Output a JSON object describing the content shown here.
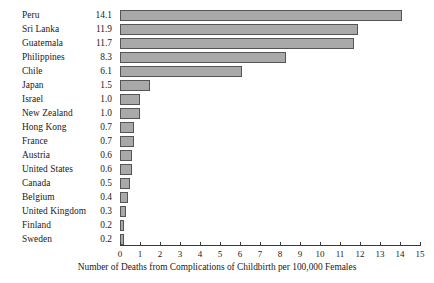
{
  "chart_data": {
    "type": "bar",
    "orientation": "horizontal",
    "title": "",
    "xlabel": "Number of Deaths from Complications of Childbirth per 100,000 Females",
    "ylabel": "",
    "xlim": [
      0,
      15
    ],
    "xticks": [
      "0",
      "1",
      "2",
      "3",
      "4",
      "5",
      "6",
      "7",
      "8",
      "9",
      "10",
      "11",
      "12",
      "13",
      "14",
      "15"
    ],
    "grid": false,
    "legend": null,
    "categories": [
      "Peru",
      "Sri Lanka",
      "Guatemala",
      "Philippines",
      "Chile",
      "Japan",
      "Israel",
      "New Zealand",
      "Hong Kong",
      "France",
      "Austria",
      "United States",
      "Canada",
      "Belgium",
      "United Kingdom",
      "Finland",
      "Sweden"
    ],
    "values": [
      14.1,
      11.9,
      11.7,
      8.3,
      6.1,
      1.5,
      1.0,
      1.0,
      0.7,
      0.7,
      0.6,
      0.6,
      0.5,
      0.4,
      0.3,
      0.2,
      0.2
    ],
    "value_labels": [
      "14.1",
      "11.9",
      "11.7",
      "8.3",
      "6.1",
      "1.5",
      "1.0",
      "1.0",
      "0.7",
      "0.7",
      "0.6",
      "0.6",
      "0.5",
      "0.4",
      "0.3",
      "0.2",
      "0.2"
    ],
    "colors": {
      "bar_fill": "#a9a9a9",
      "bar_border": "#555555",
      "axis": "#3a3a3a",
      "text": "#1a1a1a",
      "background": "#ffffff"
    }
  }
}
